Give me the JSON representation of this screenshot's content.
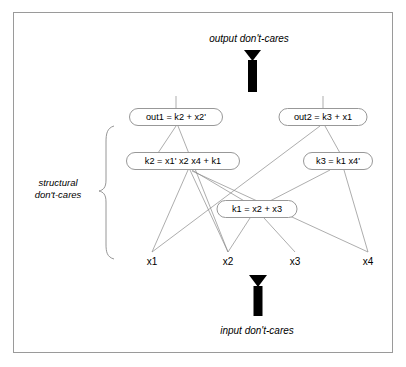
{
  "figure": {
    "captions": {
      "top": "output don't-cares",
      "bottom": "input don't-cares",
      "left_line1": "structural",
      "left_line2": "don't-cares"
    },
    "nodes": [
      {
        "id": "out1",
        "label": "out1 = k2 + x2'",
        "cx": 176,
        "cy": 117,
        "w": 93,
        "h": 17
      },
      {
        "id": "out2",
        "label": "out2 = k3 + x1",
        "cx": 323,
        "cy": 117,
        "w": 88,
        "h": 17
      },
      {
        "id": "k2",
        "label": "k2 = x1' x2 x4 + k1",
        "cx": 183,
        "cy": 161,
        "w": 113,
        "h": 17
      },
      {
        "id": "k3",
        "label": "k3 = k1 x4'",
        "cx": 338,
        "cy": 161,
        "w": 69,
        "h": 17
      },
      {
        "id": "k1",
        "label": "k1 = x2 + x3",
        "cx": 257,
        "cy": 209,
        "w": 80,
        "h": 17
      }
    ],
    "inputs": [
      {
        "id": "x1",
        "label": "x1",
        "x": 152,
        "y": 262
      },
      {
        "id": "x2",
        "label": "x2",
        "x": 228,
        "y": 262
      },
      {
        "id": "x3",
        "label": "x3",
        "x": 295,
        "y": 262
      },
      {
        "id": "x4",
        "label": "x4",
        "x": 368,
        "y": 262
      }
    ],
    "edges": [
      {
        "from": "out1",
        "to": "top-stub"
      },
      {
        "from": "out2",
        "to": "top-stub"
      },
      {
        "from": "out1",
        "to": "k2"
      },
      {
        "from": "out1",
        "to": "x2"
      },
      {
        "from": "out2",
        "to": "k3"
      },
      {
        "from": "out2",
        "to": "x1"
      },
      {
        "from": "k2",
        "to": "x1"
      },
      {
        "from": "k2",
        "to": "x2"
      },
      {
        "from": "k2",
        "to": "x4"
      },
      {
        "from": "k2",
        "to": "k1"
      },
      {
        "from": "k3",
        "to": "k1"
      },
      {
        "from": "k3",
        "to": "x4"
      },
      {
        "from": "k1",
        "to": "x2"
      },
      {
        "from": "k1",
        "to": "x3"
      }
    ],
    "colors": {
      "background": "#ffffff",
      "frame": "#9a9a9a",
      "node_stroke": "#8c8c8c",
      "edge": "#8a8a8a",
      "arrow": "#000000",
      "text": "#000000"
    }
  }
}
